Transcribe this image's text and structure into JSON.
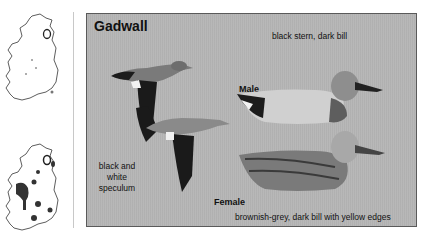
{
  "maps": [
    {
      "name": "distribution-map-breeding",
      "label": ""
    },
    {
      "name": "distribution-map-wintering",
      "label": ""
    }
  ],
  "panel": {
    "title": "Gadwall",
    "male": {
      "label": "Male",
      "description": "black stern, dark bill"
    },
    "female": {
      "label": "Female",
      "description": "brownish-grey, dark bill with yellow edges"
    },
    "flight_note": "black and white speculum"
  },
  "colors": {
    "panel_bg": "#b4b4b4",
    "panel_border": "#5a5a5a",
    "text": "#111111"
  }
}
